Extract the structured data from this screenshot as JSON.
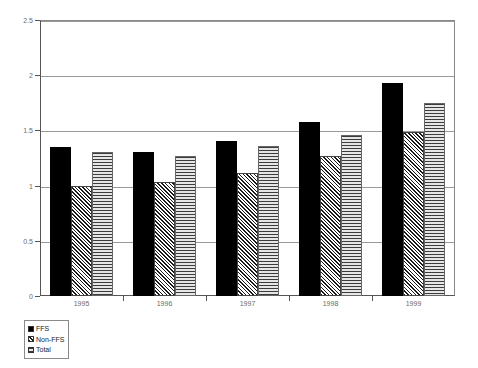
{
  "chart_data": {
    "type": "bar",
    "title": "",
    "subtitle": "",
    "xlabel": "",
    "ylabel": "",
    "categories": [
      "1995",
      "1996",
      "1997",
      "1998",
      "1999"
    ],
    "series": [
      {
        "name": "FFS",
        "pattern": "solid-black",
        "values": [
          1.35,
          1.3,
          1.4,
          1.58,
          1.93
        ]
      },
      {
        "name": "Non-FFS",
        "pattern": "diagonal-hatch",
        "values": [
          1.0,
          1.03,
          1.11,
          1.27,
          1.49
        ]
      },
      {
        "name": "Total",
        "pattern": "horizontal-lines",
        "values": [
          1.3,
          1.27,
          1.36,
          1.46,
          1.75
        ]
      }
    ],
    "ylim": [
      0,
      2.5
    ],
    "y_ticks": [
      "0",
      "0.5",
      "1",
      "1.5",
      "2",
      "2.5"
    ],
    "y_tick_values": [
      0,
      0.5,
      1,
      1.5,
      2,
      2.5
    ],
    "grid": true,
    "grid_axis": "y",
    "legend_position": "below-left",
    "colors": {
      "series_ffs": "#000000",
      "series_non_ffs": "#1a1a1a",
      "series_total": "#d2d2d2",
      "axis": "#555555",
      "gridline": "#9a9a9a",
      "tick_label": "#6b6b6b",
      "background": "#ffffff"
    }
  },
  "legend": {
    "items": [
      {
        "label": "FFS"
      },
      {
        "label": "Non-FFS"
      },
      {
        "label": "Total"
      }
    ]
  }
}
